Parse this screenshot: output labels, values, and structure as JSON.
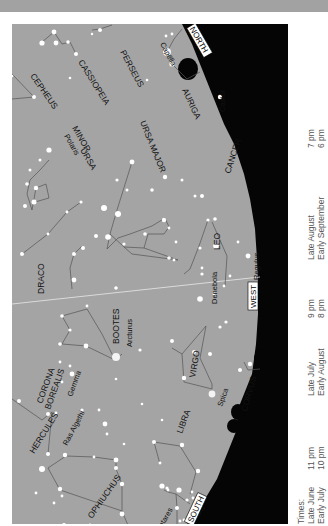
{
  "colors": {
    "sky": "#a4a4a4",
    "ground": "#050505",
    "star": "#ffffff",
    "line": "#555555",
    "label": "#111111",
    "topbar": "#a2a2a2"
  },
  "directions": {
    "north": "NORTH",
    "west": "WEST",
    "south": "SOUTH"
  },
  "constellations": [
    {
      "name": "CEPHEUS"
    },
    {
      "name": "CASSIOPEIA"
    },
    {
      "name": "PERSEUS"
    },
    {
      "name": "AURIGA"
    },
    {
      "name": "URSA MINOR"
    },
    {
      "name": "URSA MAJOR"
    },
    {
      "name": "CANCER"
    },
    {
      "name": "DRACO"
    },
    {
      "name": "LEO"
    },
    {
      "name": "BOOTES"
    },
    {
      "name": "CORONA BOREALIS"
    },
    {
      "name": "VIRGO"
    },
    {
      "name": "CORVUS"
    },
    {
      "name": "HERCULES"
    },
    {
      "name": "LIBRA"
    },
    {
      "name": "OPHIUCHUS"
    },
    {
      "name": "SCORPIUS"
    }
  ],
  "labels": {
    "cepheus": "CEPHEUS",
    "cassiopeia": "CASSIOPEIA",
    "perseus": "PERSEUS",
    "auriga": "AURIGA",
    "ursa_minor_1": "URSA",
    "ursa_minor_2": "MINOR",
    "ursa_major": "URSA MAJOR",
    "cancer": "CANCER",
    "draco": "DRACO",
    "leo": "LEO",
    "bootes": "BOOTES",
    "corona_1": "CORONA",
    "corona_2": "BOREALIS",
    "virgo": "VIRGO",
    "corvus": "CORVUS",
    "hercules": "HERCULES",
    "libra": "LIBRA",
    "ophiuchus": "OPHIUCHUS",
    "scorpius": "SCORPIUS"
  },
  "stars": {
    "capella": "Capella",
    "polaris": "Polaris",
    "castor": "Castor",
    "regulus": "Regulus",
    "denebola": "Denebola",
    "arcturus": "Arcturus",
    "gemma": "Gemma",
    "spica": "Spica",
    "ras_algethi": "Ras Algethi",
    "antares": "Antares"
  },
  "legend": {
    "header": "Times:",
    "rows": [
      {
        "dates": [
          "Late June",
          "Early July"
        ],
        "times": [
          "11 pm",
          "10 pm"
        ]
      },
      {
        "dates": [
          "Late July",
          "Early August"
        ],
        "times": [
          "9 pm",
          "8 pm"
        ]
      },
      {
        "dates": [
          "Late August",
          "Early September"
        ],
        "times": [
          "7 pm",
          "6 pm"
        ]
      }
    ]
  }
}
